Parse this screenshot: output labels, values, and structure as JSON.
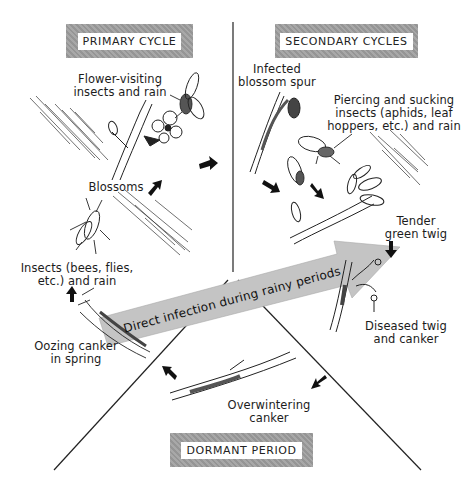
{
  "diagram": {
    "sections": {
      "primary": {
        "title": "PRIMARY CYCLE"
      },
      "secondary": {
        "title": "SECONDARY CYCLES"
      },
      "dormant": {
        "title": "DORMANT PERIOD"
      }
    },
    "labels": {
      "flower_visiting_1": "Flower-visiting",
      "flower_visiting_2": "insects and rain",
      "blossoms": "Blossoms",
      "insects_1": "Insects (bees, flies,",
      "insects_2": "etc.) and rain",
      "oozing_1": "Oozing canker",
      "oozing_2": "in spring",
      "infected_1": "Infected",
      "infected_2": "blossom spur",
      "piercing_1": "Piercing and sucking",
      "piercing_2": "insects (aphids, leaf",
      "piercing_3": "hoppers, etc.) and rain",
      "tender_1": "Tender",
      "tender_2": "green twig",
      "diseased_1": "Diseased twig",
      "diseased_2": "and canker",
      "overwintering_1": "Overwintering",
      "overwintering_2": "canker"
    },
    "central_arrow": {
      "text": "Direct infection during rainy periods",
      "color": "#bdbdbd"
    },
    "colors": {
      "title_box": "#9e9e9e",
      "ink": "#1a1a1a",
      "background": "#ffffff"
    }
  }
}
